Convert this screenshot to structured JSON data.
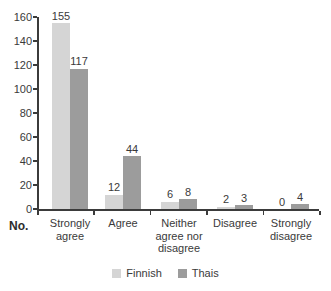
{
  "chart_data": {
    "type": "bar",
    "title": "",
    "categories": [
      "Strongly\nagree",
      "Agree",
      "Neither\nagree nor\ndisagree",
      "Disagree",
      "Strongly\ndisagree"
    ],
    "series": [
      {
        "name": "Finnish",
        "color": "#d5d5d5",
        "values": [
          155,
          12,
          6,
          2,
          0
        ]
      },
      {
        "name": "Thais",
        "color": "#9c9c9c",
        "values": [
          117,
          44,
          8,
          3,
          4
        ]
      }
    ],
    "xlabel": "",
    "ylabel": "No.",
    "ylim": [
      0,
      160
    ],
    "ytick_step": 20,
    "grid": false,
    "value_labels": true,
    "legend_position": "bottom"
  },
  "colors": {
    "axis": "#3b3b3b",
    "text": "#3a3a3a",
    "background": "#ffffff"
  }
}
